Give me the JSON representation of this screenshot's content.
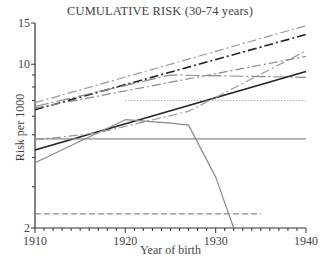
{
  "chart_data": {
    "type": "line",
    "title": "CUMULATIVE RISK (30-74 years)",
    "xlabel": "Year of birth",
    "ylabel": "Risk per 1000",
    "yscale": "log",
    "xlim": [
      1910,
      1940
    ],
    "ylim": [
      2,
      15
    ],
    "x_ticks": [
      1910,
      1920,
      1930,
      1940
    ],
    "x_minor_step": 1,
    "y_ticks_labeled": [
      2,
      10,
      15
    ],
    "y_ticks_minor": [
      3,
      4,
      5,
      6,
      7,
      8,
      9
    ],
    "grid": false,
    "legend": null,
    "series": [
      {
        "name": "series-1",
        "style": "dash-dot",
        "color": "#9a9a9a",
        "x": [
          1910,
          1940
        ],
        "values": [
          6.85,
          14.6
        ]
      },
      {
        "name": "series-2",
        "style": "dash-dot",
        "color": "#222222",
        "x": [
          1910,
          1940
        ],
        "values": [
          6.4,
          13.4
        ]
      },
      {
        "name": "series-3",
        "style": "long-dash-dot",
        "color": "#8a8a8a",
        "x": [
          1910,
          1925,
          1940
        ],
        "values": [
          6.6,
          9.0,
          8.8
        ]
      },
      {
        "name": "series-4",
        "style": "dash-dot",
        "color": "#8a8a8a",
        "x": [
          1910,
          1940
        ],
        "values": [
          6.5,
          10.8
        ]
      },
      {
        "name": "series-5",
        "style": "solid",
        "color": "#222222",
        "x": [
          1910,
          1940
        ],
        "values": [
          4.3,
          9.3
        ]
      },
      {
        "name": "series-6",
        "style": "dotted",
        "color": "#8a8a8a",
        "x": [
          1920,
          1940
        ],
        "values": [
          7.0,
          7.0
        ]
      },
      {
        "name": "series-7",
        "style": "dash-dot",
        "color": "#9a9a9a",
        "x": [
          1910,
          1917,
          1927,
          1940
        ],
        "values": [
          4.75,
          5.1,
          6.3,
          11.4
        ]
      },
      {
        "name": "series-8",
        "style": "solid",
        "color": "#8a8a8a",
        "x": [
          1910,
          1940
        ],
        "values": [
          4.8,
          4.8
        ]
      },
      {
        "name": "series-9",
        "style": "solid",
        "color": "#8a8a8a",
        "x": [
          1910,
          1920,
          1925,
          1927,
          1930,
          1932
        ],
        "values": [
          3.8,
          5.8,
          5.6,
          5.5,
          3.3,
          2.0
        ]
      },
      {
        "name": "series-10",
        "style": "dashed",
        "color": "#8a8a8a",
        "x": [
          1910,
          1935
        ],
        "values": [
          2.3,
          2.3
        ]
      }
    ]
  }
}
